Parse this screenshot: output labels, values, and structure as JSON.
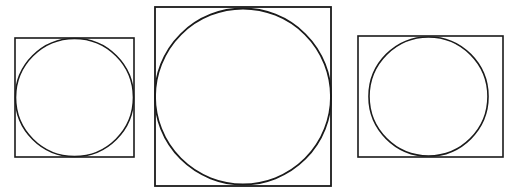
{
  "canvas": {
    "width": 514,
    "height": 194,
    "background_color": "#ffffff",
    "stroke_color": "#1a1a1a"
  },
  "figure_set": {
    "name": "three-squares-with-inscribed-circles",
    "count": 3,
    "figures": [
      {
        "id": "figure-left",
        "label": "left-figure",
        "square": {
          "x": 15,
          "y": 38,
          "width": 119,
          "height": 119,
          "stroke_width": 1.6,
          "stroke_color": "#1a1a1a",
          "fill": "none"
        },
        "circle": {
          "cx": 74.5,
          "cy": 97.5,
          "r": 59,
          "stroke_width": 1.6,
          "stroke_color": "#1a1a1a",
          "fill": "none",
          "inscribed": true
        }
      },
      {
        "id": "figure-middle",
        "label": "middle-figure",
        "square": {
          "x": 155,
          "y": 7,
          "width": 176,
          "height": 179,
          "stroke_width": 1.8,
          "stroke_color": "#1a1a1a",
          "fill": "none"
        },
        "circle": {
          "cx": 243,
          "cy": 96.5,
          "r": 88,
          "stroke_width": 1.8,
          "stroke_color": "#1a1a1a",
          "fill": "none",
          "inscribed": true
        }
      },
      {
        "id": "figure-right",
        "label": "right-figure",
        "square": {
          "x": 358,
          "y": 36,
          "width": 145,
          "height": 121,
          "stroke_width": 1.6,
          "stroke_color": "#1a1a1a",
          "fill": "none"
        },
        "circle": {
          "cx": 428.5,
          "cy": 96.5,
          "r": 59.5,
          "stroke_width": 1.6,
          "stroke_color": "#1a1a1a",
          "fill": "none",
          "inscribed": false
        }
      }
    ]
  }
}
